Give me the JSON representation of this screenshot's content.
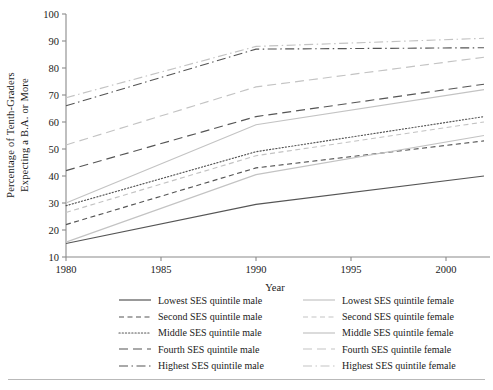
{
  "chart_data": {
    "type": "line",
    "title": "",
    "xlabel": "Year",
    "ylabel": "Percentage of Tenth-Graders Expecting a B.A. or More",
    "ylabel_line1": "Percentage of Tenth-Graders",
    "ylabel_line2": "Expecting a B.A. or More",
    "x": [
      1980,
      1990,
      2002
    ],
    "xlim": [
      1980,
      2002
    ],
    "ylim": [
      10,
      100
    ],
    "xticks": [
      1980,
      1985,
      1990,
      1995,
      2000
    ],
    "xtick_labels": [
      "1980",
      "1985",
      "1990",
      "1995",
      "2000"
    ],
    "yticks": [
      10,
      20,
      30,
      40,
      50,
      60,
      70,
      80,
      90,
      100
    ],
    "ytick_labels": [
      "10",
      "20",
      "30",
      "40",
      "50",
      "60",
      "70",
      "80",
      "90",
      "100"
    ],
    "grid": false,
    "legend_position": "below-axes",
    "series": [
      {
        "name": "Lowest SES quintile male",
        "values": [
          15,
          29.5,
          40
        ],
        "color": "#555555",
        "style": "solid"
      },
      {
        "name": "Second SES quintile male",
        "values": [
          22,
          43,
          53
        ],
        "color": "#555555",
        "style": "dashed-short"
      },
      {
        "name": "Middle SES quintile male",
        "values": [
          29,
          49,
          62
        ],
        "color": "#555555",
        "style": "dotted"
      },
      {
        "name": "Fourth SES quintile male",
        "values": [
          42,
          62,
          74
        ],
        "color": "#555555",
        "style": "dashed-long"
      },
      {
        "name": "Highest SES quintile male",
        "values": [
          66,
          87,
          87.5
        ],
        "color": "#555555",
        "style": "dash-dot"
      },
      {
        "name": "Lowest SES quintile female",
        "values": [
          15.5,
          40.5,
          55
        ],
        "color": "#c3c3c3",
        "style": "solid"
      },
      {
        "name": "Second SES quintile female",
        "values": [
          26.5,
          47.5,
          60
        ],
        "color": "#c3c3c3",
        "style": "dashed-short"
      },
      {
        "name": "Middle SES quintile female",
        "values": [
          30,
          59,
          72
        ],
        "color": "#c3c3c3",
        "style": "solid"
      },
      {
        "name": "Fourth SES quintile female",
        "values": [
          51.5,
          73,
          84
        ],
        "color": "#c3c3c3",
        "style": "dashed-long"
      },
      {
        "name": "Highest SES quintile female",
        "values": [
          69,
          88,
          91
        ],
        "color": "#c3c3c3",
        "style": "dash-dot"
      }
    ]
  },
  "legend": {
    "column1": [
      "Lowest SES quintile male",
      "Second SES quintile male",
      "Middle SES quintile male",
      "Fourth SES quintile male",
      "Highest SES quintile male"
    ],
    "column2": [
      "Lowest SES quintile female",
      "Second SES quintile female",
      "Middle SES quintile female",
      "Fourth SES quintile female",
      "Highest SES quintile female"
    ]
  },
  "colors": {
    "male_line": "#555555",
    "female_line": "#c3c3c3",
    "axis": "#8a8a8a",
    "text": "#1a1a1a",
    "background": "#ffffff",
    "rule": "#b9b9b9"
  }
}
